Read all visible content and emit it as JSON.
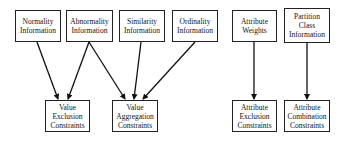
{
  "diagram": {
    "sources": [
      {
        "id": "normality",
        "lines": [
          "Normality",
          "Information"
        ]
      },
      {
        "id": "abnormality",
        "lines": [
          "Abnormality",
          "Information"
        ]
      },
      {
        "id": "similarity",
        "lines": [
          "Similarity",
          "Information"
        ]
      },
      {
        "id": "ordinality",
        "lines": [
          "Ordinality",
          "Information"
        ]
      },
      {
        "id": "attribute-weights",
        "lines": [
          "Attribute",
          "Weights"
        ]
      },
      {
        "id": "partition-class",
        "lines": [
          "Partition",
          "Class",
          "Information"
        ]
      }
    ],
    "targets": [
      {
        "id": "value-exclusion",
        "lines": [
          "Value",
          "Exclusion",
          "Constraints"
        ]
      },
      {
        "id": "value-aggregation",
        "lines": [
          "Value",
          "Aggregation",
          "Constraints"
        ]
      },
      {
        "id": "attribute-exclusion",
        "lines": [
          "Attribute",
          "Exclusion",
          "Constraints"
        ]
      },
      {
        "id": "attribute-combination",
        "lines": [
          "Attribute",
          "Combination",
          "Constraints"
        ]
      }
    ],
    "edges": [
      {
        "from": "normality",
        "to": "value-exclusion"
      },
      {
        "from": "abnormality",
        "to": "value-exclusion"
      },
      {
        "from": "abnormality",
        "to": "value-aggregation"
      },
      {
        "from": "similarity",
        "to": "value-aggregation"
      },
      {
        "from": "ordinality",
        "to": "value-aggregation"
      },
      {
        "from": "attribute-weights",
        "to": "attribute-exclusion"
      },
      {
        "from": "partition-class",
        "to": "attribute-combination"
      }
    ]
  }
}
